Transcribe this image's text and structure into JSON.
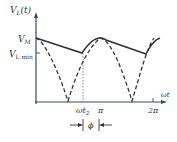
{
  "diagram": {
    "y_label": "V_L(t)",
    "y_label_main": "V",
    "y_label_sub": "L",
    "y_label_arg": "(t)",
    "vm_label_main": "V",
    "vm_label_sub": "M",
    "vlmin_label_main": "V",
    "vlmin_label_sub": "L min",
    "x_label": "ωt",
    "tick_wt2_main": "ωt",
    "tick_wt2_sub": "2",
    "tick_pi": "π",
    "tick_2pi": "2π",
    "phi_label": "ϕ",
    "colors": {
      "line": "#333333",
      "axis": "#3a4a5a"
    }
  }
}
